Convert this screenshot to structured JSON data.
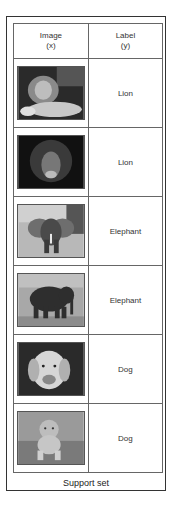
{
  "figure": {
    "caption": "Support set",
    "headers": {
      "image": {
        "line1": "Image",
        "line2": "(x)"
      },
      "label": {
        "line1": "Label",
        "line2": "(y)"
      }
    },
    "rows": [
      {
        "image": "lion-lying-photo",
        "label": "Lion"
      },
      {
        "image": "lion-face-photo",
        "label": "Lion"
      },
      {
        "image": "elephant-front-photo",
        "label": "Elephant"
      },
      {
        "image": "elephant-side-photo",
        "label": "Elephant"
      },
      {
        "image": "golden-retriever-photo",
        "label": "Dog"
      },
      {
        "image": "puppy-photo",
        "label": "Dog"
      }
    ]
  }
}
